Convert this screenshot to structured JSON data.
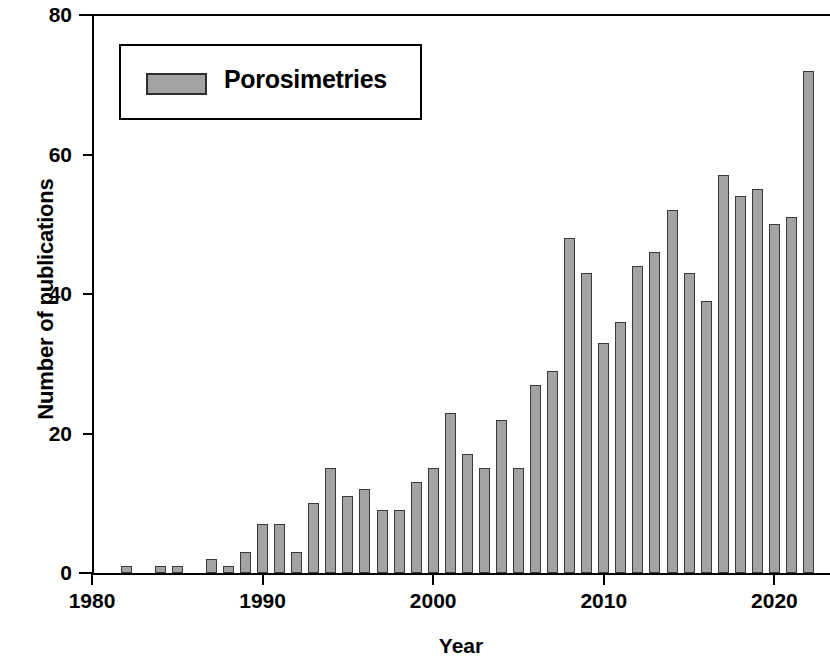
{
  "chart_data": {
    "type": "bar",
    "title": "",
    "xlabel": "Year",
    "ylabel": "Number of publications",
    "xlim": [
      1980,
      2024
    ],
    "ylim": [
      0,
      80
    ],
    "xticks": [
      1980,
      1990,
      2000,
      2010,
      2020
    ],
    "yticks": [
      0,
      20,
      40,
      60,
      80
    ],
    "grid": false,
    "legend_position": "top-left",
    "series": [
      {
        "name": "Porosimetries",
        "color": "#a3a3a3",
        "edge_color": "#3a3a3a",
        "categories": [
          1982,
          1984,
          1985,
          1987,
          1988,
          1989,
          1990,
          1991,
          1992,
          1993,
          1994,
          1995,
          1996,
          1997,
          1998,
          1999,
          2000,
          2001,
          2002,
          2003,
          2004,
          2005,
          2006,
          2007,
          2008,
          2009,
          2010,
          2011,
          2012,
          2013,
          2014,
          2015,
          2016,
          2017,
          2018,
          2019,
          2020,
          2021,
          2022
        ],
        "values": [
          1,
          1,
          1,
          2,
          1,
          3,
          7,
          7,
          3,
          10,
          15,
          11,
          12,
          9,
          9,
          13,
          15,
          23,
          17,
          15,
          22,
          15,
          27,
          29,
          48,
          43,
          33,
          36,
          44,
          46,
          52,
          43,
          39,
          57,
          54,
          55,
          50,
          51,
          72
        ]
      }
    ]
  },
  "legend": {
    "label": "Porosimetries"
  },
  "axes": {
    "y_title": "Number of publications",
    "x_title": "Year",
    "y_tick_labels": [
      "80",
      "60",
      "40",
      "20",
      "0"
    ],
    "x_tick_labels": [
      "1980",
      "1990",
      "2000",
      "2010",
      "2020"
    ]
  }
}
